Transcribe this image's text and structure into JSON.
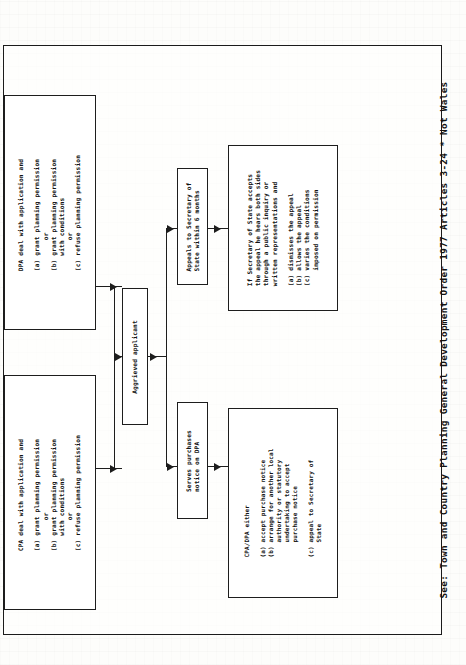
{
  "document": {
    "kind": "scanned-flowchart",
    "orientation": "rotated-90-ccw",
    "ink_color": "#1d1d1d",
    "paper_color": "#fdfdfb"
  },
  "footer": {
    "prefix": "See:",
    "reference": "Town and Country Planning General Development Order 1977 Articles 3-24",
    "note": "* Not Wales",
    "full": "See:  Town and Country Planning General Development Order 1977 Articles 3-24    * Not Wales"
  },
  "nodes": {
    "cpa_decision": {
      "id": "cpa-decision",
      "heading": "CPA deal with application and",
      "options": [
        "(a) grant planning permission",
        "        or",
        "(b) grant planning permission",
        "    with conditions",
        "        or",
        "(c) refuse planning permission"
      ],
      "text": "CPA deal with application and\n\n(a) grant planning permission\n        or\n(b) grant planning permission\n    with conditions\n        or\n(c) refuse planning permission"
    },
    "dpa_decision": {
      "id": "dpa-decision",
      "heading": "DPA deal with application and",
      "options": [
        "(a) grant planning permission",
        "        or",
        "(b) grant planning permission",
        "    with conditions",
        "        or",
        "(c) refuse planning permission"
      ],
      "text": "DPA deal with application and\n\n(a) grant planning permission\n        or\n(b) grant planning permission\n    with conditions\n        or\n(c) refuse planning permission"
    },
    "aggrieved_applicant": {
      "id": "aggrieved-applicant",
      "text": "Aggrieved applicant"
    },
    "appeals_secretary": {
      "id": "appeals-to-secretary-of-state",
      "text": "Appeals to Secretary of\nState within 6 months"
    },
    "secretary_outcome": {
      "id": "secretary-of-state-outcome",
      "heading": "If Secretary of State accepts\nthe appeal he hears both sides\nthrough a public inquiry or\nwritten representations and",
      "options": [
        "(a) dismisses the appeal",
        "(b) allows the appeal",
        "(c) varies the conditions",
        "    imposed on permission"
      ],
      "text": "If Secretary of State accepts\nthe appeal he hears both sides\nthrough a public inquiry or\nwritten representations and\n\n(a) dismisses the appeal\n(b) allows the appeal\n(c) varies the conditions\n    imposed on permission"
    },
    "purchase_notice": {
      "id": "serves-purchase-notice",
      "text": "Serves purchases\nnotice on DPA"
    },
    "cpa_dpa_either": {
      "id": "cpa-dpa-either-outcome",
      "heading": "CPA/DPA either",
      "options": [
        "(a) accept purchase notice",
        "(b) arrange for another local",
        "    authority or statutory",
        "    undertaking to accept",
        "    purchase notice",
        "",
        "(c) appeal to Secretary of",
        "    State"
      ],
      "text": "CPA/DPA either\n\n(a) accept purchase notice\n(b) arrange for another local\n    authority or statutory\n    undertaking to accept\n    purchase notice\n\n(c) appeal to Secretary of\n    State"
    }
  },
  "edges": [
    {
      "from": "cpa_decision",
      "to": "aggrieved_applicant"
    },
    {
      "from": "dpa_decision",
      "to": "aggrieved_applicant"
    },
    {
      "from": "aggrieved_applicant",
      "to": "appeals_secretary"
    },
    {
      "from": "aggrieved_applicant",
      "to": "purchase_notice"
    },
    {
      "from": "appeals_secretary",
      "to": "secretary_outcome"
    },
    {
      "from": "purchase_notice",
      "to": "cpa_dpa_either"
    }
  ]
}
